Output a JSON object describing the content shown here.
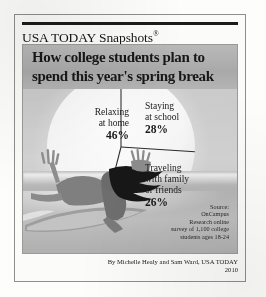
{
  "brand": {
    "name": "USA TODAY Snapshots",
    "registered_mark": "®"
  },
  "headline": "How college students plan to spend this year's spring break",
  "labels": [
    {
      "name": "Relaxing at home",
      "line1": "Relaxing",
      "line2": "at home",
      "pct": "46%"
    },
    {
      "name": "Staying at school",
      "line1": "Staying",
      "line2": "at school",
      "pct": "28%"
    },
    {
      "name": "Traveling with family or friends",
      "line1": "Traveling",
      "line2": "with family",
      "line3": "or friends",
      "pct": "26%"
    }
  ],
  "source": {
    "line1": "Source:",
    "line2": "OnCampus",
    "line3": "Research online",
    "line4": "survey of 1,100 college",
    "line5": "students ages 18-24"
  },
  "credit": {
    "byline": "By Michelle Healy and Sam Ward, USA TODAY",
    "year": "2010"
  },
  "colors": {
    "ink": "#1a1a1a",
    "rule": "#1b1b1b",
    "frame": "#8e8e8e",
    "panel_bg": "#cfcfcf",
    "headline_band": "#a9a9a9",
    "sun_fill": "#fbfbfb",
    "water": "#b5b5b5"
  },
  "chart_data": {
    "type": "pie",
    "title": "How college students plan to spend this year's spring break",
    "subtitle": "",
    "xlabel": "",
    "ylabel": "",
    "categories": [
      "Relaxing at home",
      "Staying at school",
      "Traveling with family or friends"
    ],
    "values": [
      46,
      28,
      26
    ],
    "value_labels": [
      "46%",
      "28%",
      "26%"
    ],
    "units": "percent",
    "total": 100,
    "legend": "none",
    "grid": false,
    "annotations": [
      "Source: OnCampus Research online survey of 1,100 college students ages 18-24",
      "By Michelle Healy and Sam Ward, USA TODAY",
      "2010"
    ],
    "start_angle_deg": -90,
    "direction": "counterclockwise",
    "style": "newspaper grayscale infographic; pie drawn as a rising sun behind a surfer"
  }
}
